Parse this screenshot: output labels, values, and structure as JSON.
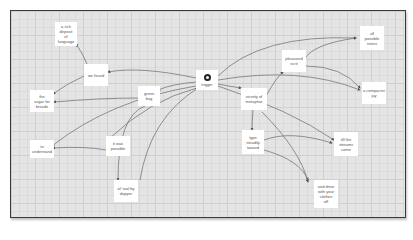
{
  "diagram": {
    "type": "concept-map",
    "center": {
      "id": "n_center",
      "label": "trigger",
      "icon": "record-icon"
    },
    "nodes": [
      {
        "id": "n1",
        "label": "a rich\ndeposit\nof\nlanguage"
      },
      {
        "id": "n2",
        "label": "we found"
      },
      {
        "id": "n3",
        "label": "the\nsugar for\nbreads"
      },
      {
        "id": "n4",
        "label": "green\nbug"
      },
      {
        "id": "n5",
        "label": "to\nunderstand"
      },
      {
        "id": "n6",
        "label": "it was\npossible"
      },
      {
        "id": "n7",
        "label": "ol' tool by\ndapper"
      },
      {
        "id": "n8",
        "label": "vicinity of\nmetaphor"
      },
      {
        "id": "n9",
        "label": "pleasured\nscrit"
      },
      {
        "id": "n10",
        "label": "all\npossible\nnotes"
      },
      {
        "id": "n11",
        "label": "a compacter\njay"
      },
      {
        "id": "n12",
        "label": "type\nsteadily\ntoward"
      },
      {
        "id": "n13",
        "label": "till the\nstreams\ncome"
      },
      {
        "id": "n14",
        "label": "and drive\nwith your\nclothes\noff"
      }
    ],
    "edges": [
      [
        "n2",
        "n1"
      ],
      [
        "n2",
        "n3"
      ],
      [
        "n_center",
        "n2"
      ],
      [
        "n_center",
        "n4"
      ],
      [
        "n4",
        "n3"
      ],
      [
        "n_center",
        "n5"
      ],
      [
        "n6",
        "n5"
      ],
      [
        "n4",
        "n7"
      ],
      [
        "n_center",
        "n6"
      ],
      [
        "n7",
        "n_center"
      ],
      [
        "n_center",
        "n8"
      ],
      [
        "n8",
        "n9"
      ],
      [
        "n9",
        "n10"
      ],
      [
        "n9",
        "n11"
      ],
      [
        "n_center",
        "n10"
      ],
      [
        "n_center",
        "n11"
      ],
      [
        "n8",
        "n12"
      ],
      [
        "n12",
        "n13"
      ],
      [
        "n12",
        "n14"
      ],
      [
        "n8",
        "n14"
      ],
      [
        "n_center",
        "n13"
      ]
    ],
    "colors": {
      "background": "#e4e4e4",
      "grid": "#cfcfcf",
      "node": "#ffffff",
      "edge": "#6e6e6e",
      "frame": "#3a3a3a"
    }
  }
}
